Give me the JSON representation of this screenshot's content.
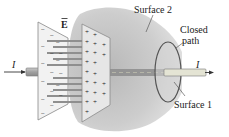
{
  "figure": {
    "labels": {
      "surface2": "Surface 2",
      "closed_path_line1": "Closed",
      "closed_path_line2": "path",
      "surface1": "Surface 1",
      "current_left": "I",
      "current_right": "I",
      "field": "E"
    },
    "plate_signs": {
      "negative": "−",
      "positive": "+"
    },
    "colors": {
      "surface2_fill": "#c8c8c8",
      "plate_fill": "#efefef",
      "plate_edge": "#888888",
      "wire": "#9a9a9a",
      "wire_highlight": "#e2e2d0",
      "closed_path": "#555555",
      "field_line": "#8f8f8f",
      "text": "#222222"
    }
  }
}
